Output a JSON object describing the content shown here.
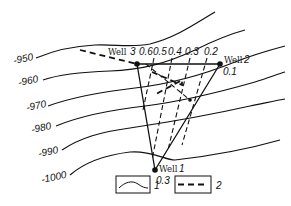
{
  "diagram": {
    "type": "structure-contour map with well triangle",
    "contour_labels": [
      "-950",
      "-960",
      "-970",
      "-980",
      "-990",
      "-1000"
    ],
    "wells": [
      {
        "name": "Well",
        "number": "3",
        "value": "0.6"
      },
      {
        "name": "Well",
        "number": "2",
        "value": "0.1"
      },
      {
        "name": "Well",
        "number": "1",
        "value": "0.3"
      }
    ],
    "isoline_labels": [
      "0.5",
      "0.4",
      "0.3",
      "0.2"
    ],
    "legend": [
      {
        "symbol": "solid-curve",
        "label": "1"
      },
      {
        "symbol": "dashed-line",
        "label": "2"
      }
    ]
  }
}
